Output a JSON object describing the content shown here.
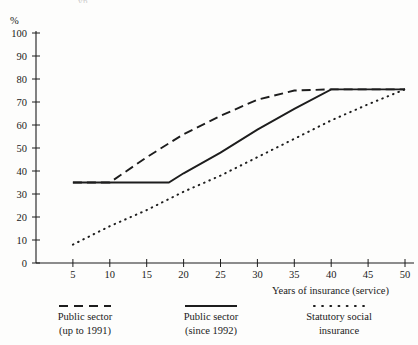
{
  "cut_off_title_fragment": "yp",
  "axes": {
    "y_unit_label": "%",
    "y_ticks": [
      "0",
      "10",
      "20",
      "30",
      "40",
      "50",
      "60",
      "70",
      "80",
      "90",
      "100"
    ],
    "x_ticks": [
      "5",
      "10",
      "15",
      "20",
      "25",
      "30",
      "35",
      "40",
      "45",
      "50"
    ],
    "x_axis_title": "Years of insurance (service)"
  },
  "legend": {
    "items": [
      {
        "key": "dashed",
        "line1": "Public sector",
        "line2": "(up to 1991)"
      },
      {
        "key": "solid",
        "line1": "Public sector",
        "line2": "(since 1992)"
      },
      {
        "key": "dotted",
        "line1": "Statutory social",
        "line2": "insurance"
      }
    ]
  },
  "colors": {
    "ink": "#1d1d1d",
    "paper": "#fdfdfc"
  },
  "chart_data": {
    "type": "line",
    "title": "",
    "xlabel": "Years of insurance (service)",
    "ylabel": "%",
    "xlim": [
      0,
      50
    ],
    "ylim": [
      0,
      100
    ],
    "xticks": [
      5,
      10,
      15,
      20,
      25,
      30,
      35,
      40,
      45,
      50
    ],
    "yticks": [
      0,
      10,
      20,
      30,
      40,
      50,
      60,
      70,
      80,
      90,
      100
    ],
    "grid": false,
    "legend_position": "bottom",
    "series": [
      {
        "name": "Public sector (up to 1991)",
        "style": "dashed",
        "x": [
          5,
          10,
          15,
          20,
          25,
          30,
          35,
          40,
          45,
          50
        ],
        "y": [
          35,
          35,
          46,
          56,
          64,
          71,
          75,
          75.5,
          75.5,
          75.5
        ]
      },
      {
        "name": "Public sector (since 1992)",
        "style": "solid",
        "x": [
          5,
          10,
          15,
          18,
          20,
          25,
          30,
          35,
          40,
          45,
          50
        ],
        "y": [
          35,
          35,
          35,
          35,
          39,
          48,
          58,
          67,
          75.5,
          75.5,
          75.5
        ]
      },
      {
        "name": "Statutory social insurance",
        "style": "dotted",
        "x": [
          5,
          10,
          15,
          20,
          25,
          30,
          35,
          40,
          45,
          50
        ],
        "y": [
          8,
          16,
          23,
          31,
          38,
          46,
          54,
          62,
          69,
          75.5
        ]
      }
    ]
  }
}
